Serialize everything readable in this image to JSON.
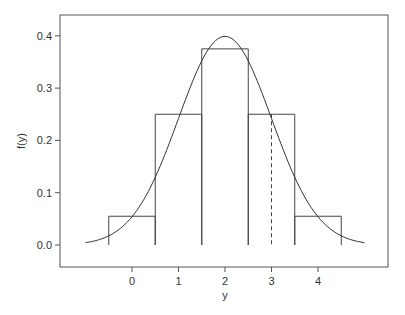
{
  "chart_data": {
    "type": "bar",
    "title": "",
    "xlabel": "y",
    "ylabel": "f(y)",
    "x_ticks": [
      "0",
      "1",
      "2",
      "3",
      "4"
    ],
    "y_ticks": [
      "0.0",
      "0.1",
      "0.2",
      "0.3",
      "0.4"
    ],
    "xlim": [
      -1.55,
      5.5
    ],
    "ylim": [
      -0.042,
      0.439
    ],
    "grid": false,
    "legend": null,
    "categories": [
      0,
      1,
      2,
      3,
      4
    ],
    "series": [
      {
        "name": "histogram",
        "kind": "step-bars",
        "bin_edges": [
          -0.5,
          0.5,
          1.5,
          2.5,
          3.5,
          4.5
        ],
        "values": [
          0.055,
          0.25,
          0.375,
          0.25,
          0.055
        ]
      },
      {
        "name": "density curve",
        "kind": "line",
        "description": "normal density, mean 2, sd 1",
        "x": [
          -1.0,
          -0.5,
          0.0,
          0.5,
          1.0,
          1.5,
          2.0,
          2.5,
          3.0,
          3.5,
          4.0,
          4.5,
          5.0
        ],
        "values": [
          0.004,
          0.018,
          0.054,
          0.13,
          0.242,
          0.352,
          0.399,
          0.352,
          0.242,
          0.13,
          0.054,
          0.018,
          0.004
        ]
      },
      {
        "name": "reference line",
        "kind": "dashed-vertical",
        "x": 3,
        "y_from": 0.0,
        "y_to": 0.25
      }
    ]
  }
}
